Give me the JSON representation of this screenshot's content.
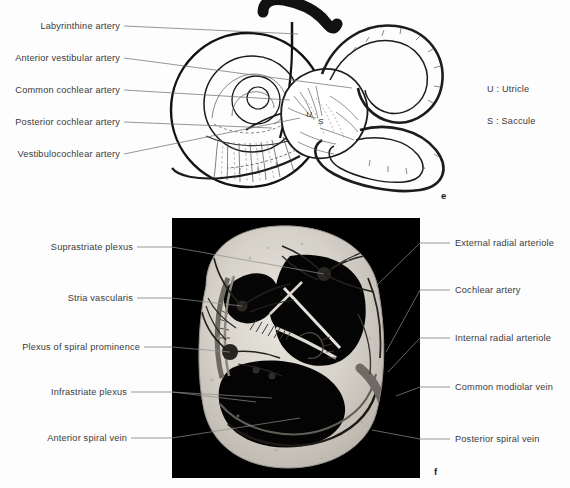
{
  "figure": {
    "type": "anatomical-illustration",
    "background_color": "#fdfdfd",
    "text_color": "#3a3a3a"
  },
  "panel_e": {
    "figure_label": "e",
    "description": "Line drawing of the membranous labyrinth with its arterial supply",
    "left_labels": [
      {
        "text": "Labyrinthine artery",
        "y": 26
      },
      {
        "text": "Anterior vestibular artery",
        "y": 58
      },
      {
        "text": "Common cochlear artery",
        "y": 90
      },
      {
        "text": "Posterior cochlear artery",
        "y": 122
      },
      {
        "text": "Vestibulocochlear artery",
        "y": 154
      }
    ],
    "legend": [
      {
        "key": "U",
        "separator": ":",
        "text": "Utricle",
        "label": "U : Utricle"
      },
      {
        "key": "S",
        "separator": ":",
        "text": "Saccule",
        "label": "S : Saccule"
      }
    ],
    "inline_markers": [
      {
        "text": "U",
        "x": 308,
        "y": 115
      },
      {
        "text": "S",
        "x": 320,
        "y": 122
      }
    ]
  },
  "panel_f": {
    "figure_label": "f",
    "description": "Photomicrograph of a cochlear cross-section showing the vascular plexuses",
    "panel_background": "#000000",
    "left_labels": [
      {
        "text": "Suprastriate plexus",
        "y": 247
      },
      {
        "text": "Stria vascularis",
        "y": 298
      },
      {
        "text": "Plexus of spiral prominence",
        "y": 347
      },
      {
        "text": "Infrastriate plexus",
        "y": 392
      },
      {
        "text": "Anterior spiral vein",
        "y": 438
      }
    ],
    "right_labels": [
      {
        "text": "External radial arteriole",
        "y": 243
      },
      {
        "text": "Cochlear artery",
        "y": 290
      },
      {
        "text": "Internal radial arteriole",
        "y": 338
      },
      {
        "text": "Common modiolar vein",
        "y": 387
      },
      {
        "text": "Posterior spiral vein",
        "y": 439
      }
    ]
  }
}
